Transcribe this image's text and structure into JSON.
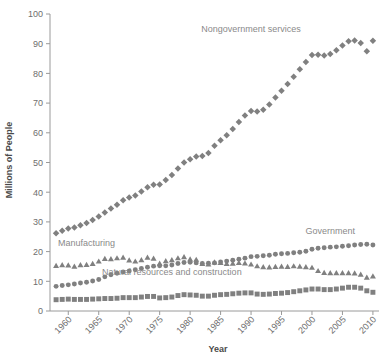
{
  "chart_data": {
    "type": "scatter",
    "title": "",
    "xlabel": "Year",
    "ylabel": "Millions of People",
    "xlim": [
      1957,
      2011
    ],
    "ylim": [
      0,
      100
    ],
    "xticks": [
      "1960",
      "1965",
      "1970",
      "1975",
      "1980",
      "1985",
      "1990",
      "1995",
      "2000",
      "2005",
      "2010"
    ],
    "yticks": [
      "0",
      "10",
      "20",
      "30",
      "40",
      "50",
      "60",
      "70",
      "80",
      "90",
      "100"
    ],
    "grid": false,
    "legend_position": "inline-annotations",
    "marker_color": "#808080",
    "x": [
      1958,
      1959,
      1960,
      1961,
      1962,
      1963,
      1964,
      1965,
      1966,
      1967,
      1968,
      1969,
      1970,
      1971,
      1972,
      1973,
      1974,
      1975,
      1976,
      1977,
      1978,
      1979,
      1980,
      1981,
      1982,
      1983,
      1984,
      1985,
      1986,
      1987,
      1988,
      1989,
      1990,
      1991,
      1992,
      1993,
      1994,
      1995,
      1996,
      1997,
      1998,
      1999,
      2000,
      2001,
      2002,
      2003,
      2004,
      2005,
      2006,
      2007,
      2008,
      2009,
      2010
    ],
    "series": [
      {
        "name": "Nongovernment services",
        "marker": "diamond",
        "color": "#808080",
        "label_x": 1990,
        "label_y": 94,
        "values": [
          26.2,
          27.0,
          27.8,
          28.1,
          28.9,
          29.6,
          30.6,
          31.8,
          33.2,
          34.5,
          35.8,
          37.3,
          38.2,
          38.9,
          40.2,
          41.7,
          42.5,
          42.6,
          44.1,
          45.8,
          48.0,
          50.0,
          51.1,
          52.0,
          52.2,
          53.2,
          55.6,
          57.5,
          59.2,
          61.3,
          63.6,
          65.8,
          67.3,
          67.2,
          67.8,
          69.5,
          71.9,
          74.2,
          76.4,
          78.9,
          81.4,
          83.8,
          86.2,
          86.3,
          86.0,
          86.5,
          87.8,
          89.4,
          90.8,
          91.1,
          90.2,
          87.5,
          91.0
        ]
      },
      {
        "name": "Manufacturing",
        "marker": "triangle",
        "color": "#808080",
        "label_x": 1963,
        "label_y": 22,
        "values": [
          15.2,
          15.5,
          15.4,
          15.0,
          15.5,
          15.6,
          15.9,
          16.7,
          17.6,
          17.5,
          17.8,
          18.0,
          17.1,
          16.7,
          17.2,
          18.0,
          17.7,
          16.0,
          16.8,
          17.2,
          17.8,
          18.2,
          17.4,
          17.3,
          15.9,
          15.7,
          16.4,
          16.2,
          15.9,
          16.0,
          16.2,
          16.1,
          15.7,
          15.1,
          14.8,
          14.7,
          14.9,
          15.0,
          14.9,
          15.1,
          15.0,
          14.8,
          14.6,
          13.5,
          12.9,
          12.8,
          12.8,
          12.8,
          12.8,
          12.7,
          12.3,
          11.3,
          11.7
        ]
      },
      {
        "name": "Government",
        "marker": "circle",
        "color": "#808080",
        "label_x": 2003,
        "label_y": 26,
        "values": [
          8.3,
          8.6,
          8.8,
          9.1,
          9.4,
          9.7,
          10.1,
          10.6,
          11.5,
          12.2,
          12.7,
          13.1,
          13.5,
          13.9,
          14.3,
          14.7,
          15.1,
          15.2,
          15.2,
          15.5,
          16.0,
          16.3,
          16.4,
          16.2,
          16.0,
          16.1,
          16.2,
          16.5,
          16.8,
          17.1,
          17.4,
          17.8,
          18.3,
          18.4,
          18.6,
          18.8,
          19.1,
          19.3,
          19.4,
          19.6,
          19.8,
          20.1,
          20.8,
          21.1,
          21.3,
          21.5,
          21.6,
          21.8,
          22.0,
          22.2,
          22.4,
          22.5,
          22.2
        ]
      },
      {
        "name": "Natural resources and construction",
        "marker": "square",
        "color": "#808080",
        "label_x": 1977,
        "label_y": 12,
        "values": [
          3.8,
          3.9,
          4.0,
          3.9,
          3.9,
          3.9,
          4.0,
          4.1,
          4.2,
          4.2,
          4.3,
          4.5,
          4.5,
          4.5,
          4.7,
          4.9,
          4.9,
          4.4,
          4.5,
          4.7,
          5.2,
          5.5,
          5.4,
          5.3,
          5.0,
          5.0,
          5.3,
          5.5,
          5.6,
          5.8,
          6.0,
          6.1,
          6.1,
          5.7,
          5.6,
          5.7,
          5.9,
          6.0,
          6.2,
          6.5,
          6.8,
          7.1,
          7.4,
          7.4,
          7.2,
          7.2,
          7.4,
          7.7,
          8.0,
          8.0,
          7.7,
          6.8,
          6.3
        ]
      }
    ]
  }
}
